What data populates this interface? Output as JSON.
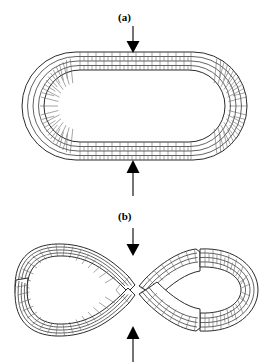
{
  "figure": {
    "background_color": "#ffffff",
    "stroke_color": "#3a3a3a",
    "arrow_color": "#000000",
    "wall_fill": "#ffffff",
    "width": 270,
    "height": 364
  },
  "panels": [
    {
      "id": "panel-a",
      "label": "(a)",
      "caption": "(a)",
      "shape": "stadium-ring",
      "description": "Unbuckled elongated ring (stadium / oval) wall with four concentric layers of brick-like cells, loaded by opposed vertical arrows",
      "wall_layers": 4,
      "fractures": 0,
      "arrows": [
        {
          "name": "top-load-arrow",
          "direction": "down",
          "x": 133,
          "y_tail": 26,
          "y_head": 52
        },
        {
          "name": "bottom-load-arrow",
          "direction": "up",
          "x": 133,
          "y_tail": 196,
          "y_head": 160
        }
      ]
    },
    {
      "id": "panel-b",
      "label": "(b)",
      "caption": "(b)",
      "shape": "figure-eight-ring",
      "description": "Buckled ring collapsed into a figure-eight with four fractured wall segments separated by gaps, loaded by opposed vertical arrows",
      "wall_layers": 4,
      "fractures": 4,
      "arrows": [
        {
          "name": "top-load-arrow",
          "direction": "down",
          "x": 133,
          "y_tail": 228,
          "y_head": 255
        },
        {
          "name": "bottom-load-arrow",
          "direction": "up",
          "x": 133,
          "y_tail": 360,
          "y_head": 326
        }
      ]
    }
  ],
  "labels": {
    "a": "(a)",
    "b": "(b)"
  }
}
